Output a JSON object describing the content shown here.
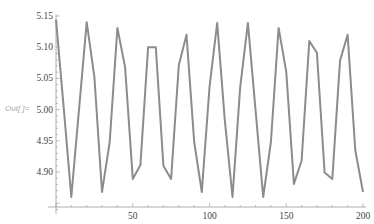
{
  "cell": {
    "out_label": "Out[ ]="
  },
  "chart_data": {
    "type": "line",
    "title": "",
    "xlabel": "",
    "ylabel": "",
    "xlim": [
      0,
      200
    ],
    "ylim": [
      4.845,
      5.155
    ],
    "grid": false,
    "legend": null,
    "x_ticks": [
      50,
      100,
      150,
      200
    ],
    "x_tick_labels": [
      "50",
      "100",
      "150",
      "200"
    ],
    "y_ticks": [
      4.9,
      4.95,
      5.0,
      5.05,
      5.1,
      5.15
    ],
    "y_tick_labels": [
      "4.90",
      "4.95",
      "5.00",
      "5.05",
      "5.10",
      "5.15"
    ],
    "line_color": "#8c8c8c",
    "series": [
      {
        "name": "data",
        "x": [
          0,
          5,
          10,
          15,
          20,
          25,
          30,
          35,
          40,
          45,
          50,
          55,
          60,
          65,
          70,
          75,
          80,
          85,
          90,
          95,
          100,
          105,
          110,
          115,
          120,
          125,
          130,
          135,
          140,
          145,
          150,
          155,
          160,
          165,
          170,
          175,
          180,
          185,
          190,
          195,
          200
        ],
        "values": [
          5.144,
          5.003,
          4.86,
          5.0,
          5.14,
          5.052,
          4.868,
          4.948,
          5.131,
          5.068,
          4.889,
          4.911,
          5.1,
          5.1,
          4.91,
          4.889,
          5.071,
          5.12,
          4.948,
          4.868,
          5.036,
          5.139,
          4.983,
          4.86,
          5.036,
          5.139,
          5.0,
          4.86,
          4.948,
          5.131,
          5.06,
          4.881,
          4.918,
          5.11,
          5.091,
          4.899,
          4.889,
          5.078,
          5.12,
          4.935,
          4.868
        ]
      }
    ]
  }
}
